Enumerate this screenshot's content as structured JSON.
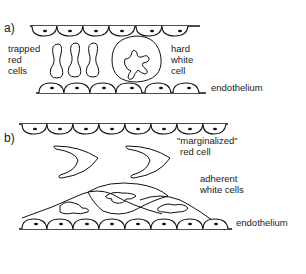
{
  "panel_a": {
    "label": "a)",
    "text": {
      "trapped_1": "trapped",
      "trapped_2": "red",
      "trapped_3": "cells",
      "hard_1": "hard",
      "hard_2": "white",
      "hard_3": "cell",
      "endothelium": "endothelium"
    }
  },
  "panel_b": {
    "label": "b)",
    "text": {
      "marg_1": "\"marginalized\"",
      "marg_2": "red cell",
      "adh_1": "adherent",
      "adh_2": "white cells",
      "endothelium": "endothelium"
    }
  },
  "colors": {
    "ink": "#111111",
    "background": "#ffffff"
  }
}
